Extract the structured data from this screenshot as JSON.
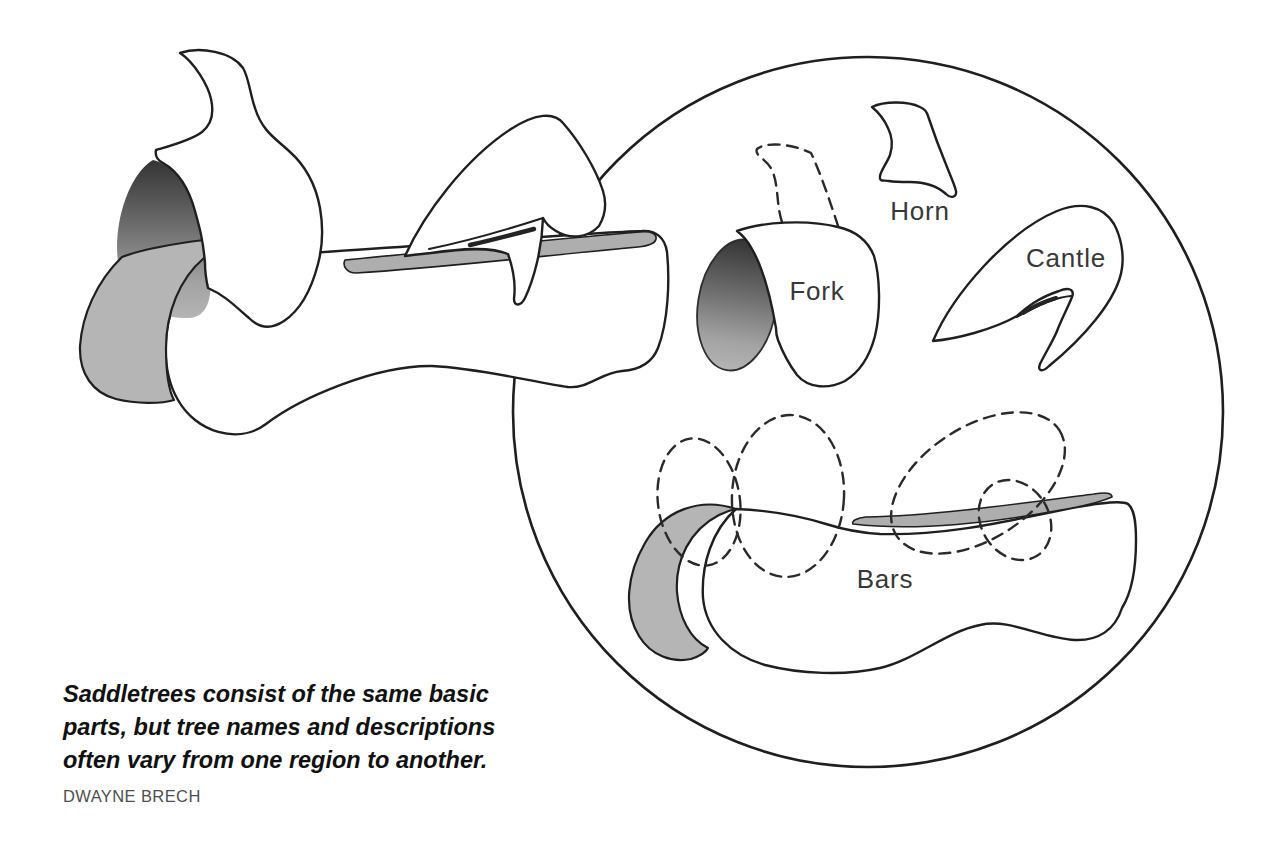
{
  "figure": {
    "type": "illustration",
    "labels": {
      "horn": "Horn",
      "fork": "Fork",
      "cantle": "Cantle",
      "bars": "Bars"
    },
    "caption": {
      "lines": [
        "Saddletrees consist of the same basic",
        "parts, but tree names and descriptions",
        "often vary from one region to another."
      ],
      "credit": "DWAYNE BRECH"
    },
    "colors": {
      "ink": "#1f1f1f",
      "paper": "#ffffff",
      "shade_gray": "#b5b5b5",
      "strip_gray": "#aeaeae",
      "shade_dark": "#373737",
      "label_text": "#383838"
    }
  }
}
